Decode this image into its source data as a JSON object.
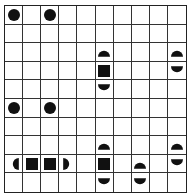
{
  "grid": {
    "rows": 10,
    "cols": 10,
    "line_color": "#333333",
    "fill_color": "#111111",
    "shapes": [
      {
        "row": 0,
        "col": 0,
        "type": "circle"
      },
      {
        "row": 0,
        "col": 2,
        "type": "circle"
      },
      {
        "row": 2,
        "col": 5,
        "type": "half-top"
      },
      {
        "row": 2,
        "col": 9,
        "type": "half-top"
      },
      {
        "row": 3,
        "col": 5,
        "type": "square"
      },
      {
        "row": 3,
        "col": 9,
        "type": "half-bottom"
      },
      {
        "row": 4,
        "col": 5,
        "type": "half-bottom"
      },
      {
        "row": 5,
        "col": 0,
        "type": "circle"
      },
      {
        "row": 5,
        "col": 2,
        "type": "circle"
      },
      {
        "row": 7,
        "col": 5,
        "type": "half-top"
      },
      {
        "row": 7,
        "col": 9,
        "type": "half-top"
      },
      {
        "row": 8,
        "col": 0,
        "type": "half-left"
      },
      {
        "row": 8,
        "col": 1,
        "type": "square"
      },
      {
        "row": 8,
        "col": 2,
        "type": "square"
      },
      {
        "row": 8,
        "col": 3,
        "type": "half-right"
      },
      {
        "row": 8,
        "col": 5,
        "type": "square"
      },
      {
        "row": 8,
        "col": 7,
        "type": "half-top"
      },
      {
        "row": 8,
        "col": 9,
        "type": "half-bottom"
      },
      {
        "row": 9,
        "col": 5,
        "type": "half-bottom"
      },
      {
        "row": 9,
        "col": 7,
        "type": "half-bottom"
      }
    ]
  }
}
